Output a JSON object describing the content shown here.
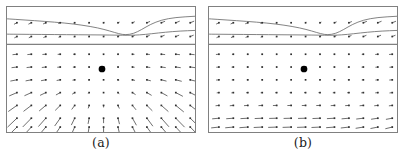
{
  "figure": {
    "background": "#ffffff",
    "border_color": "#808080",
    "arrow_color": "#3a3a3a",
    "node_color": "#2b2b2b",
    "curve_color": "#6b6b6b",
    "center_marker_color": "#000000",
    "panel_width": 190,
    "panel_height": 127
  },
  "panels": [
    {
      "id": "a",
      "caption": "(a)",
      "field_type": "divergent-fan",
      "grid": {
        "cols": 13,
        "rows": 7,
        "band_rows": 2
      },
      "divider_y": 38,
      "center_marker": {
        "x": 96,
        "y": 63,
        "r": 3.4
      },
      "chart_data_ref": 0
    },
    {
      "id": "b",
      "caption": "(b)",
      "field_type": "uniform-leftward",
      "grid": {
        "cols": 13,
        "rows": 7,
        "band_rows": 2
      },
      "divider_y": 38,
      "center_marker": {
        "x": 96,
        "y": 63,
        "r": 3.4
      },
      "chart_data_ref": 1
    }
  ],
  "chart_data": [
    {
      "type": "quiver",
      "title": "(a)",
      "xlabel": "",
      "ylabel": "",
      "xlim": [
        0,
        190
      ],
      "ylim": [
        0,
        127
      ],
      "grid": false,
      "legend": "none",
      "description": "Vector field with divergent fan pattern below a two-row upper band; arrows splay outward and downward, lengthening toward the bottom.",
      "band": {
        "rows_y": [
          16,
          30
        ],
        "x_start": 10,
        "x_step": 14.6,
        "cols": 13,
        "u": [
          -2.6,
          -2.6,
          -2.4,
          -1.6,
          -0.8,
          -0.3,
          0.4,
          1.2,
          2.0,
          2.8,
          3.4,
          3.6,
          3.6
        ],
        "v": [
          1.4,
          1.3,
          1.1,
          0.7,
          0.3,
          0.1,
          -0.2,
          -0.5,
          -0.9,
          -1.2,
          -1.4,
          -1.5,
          -1.5
        ]
      },
      "curves": [
        {
          "name": "upper-contour",
          "points": [
            [
              0,
              12
            ],
            [
              18,
              13.2
            ],
            [
              38,
              14.6
            ],
            [
              58,
              16.2
            ],
            [
              76,
              18.4
            ],
            [
              92,
              21.2
            ],
            [
              104,
              24.4
            ],
            [
              113,
              27.2
            ],
            [
              120,
              28.4
            ],
            [
              128,
              27.0
            ],
            [
              136,
              23.0
            ],
            [
              145,
              17.6
            ],
            [
              156,
              13.2
            ],
            [
              170,
              10.6
            ],
            [
              190,
              9.4
            ]
          ]
        },
        {
          "name": "lower-contour",
          "points": [
            [
              0,
              27.6
            ],
            [
              22,
              27.8
            ],
            [
              48,
              28.0
            ],
            [
              72,
              28.2
            ],
            [
              96,
              28.4
            ],
            [
              112,
              28.6
            ],
            [
              122,
              28.8
            ],
            [
              134,
              28.4
            ],
            [
              146,
              27.2
            ],
            [
              160,
              25.6
            ],
            [
              175,
              24.4
            ],
            [
              190,
              23.8
            ]
          ]
        }
      ],
      "field": {
        "x_start": 10,
        "x_step": 14.6,
        "y_start": 48,
        "y_step": 13.4,
        "cols": 13,
        "rows": 7,
        "rows_data": [
          {
            "y": 48,
            "u": [
              -4.0,
              -3.6,
              -3.0,
              -2.2,
              -1.2,
              -0.3,
              0.0,
              0.6,
              1.6,
              2.6,
              3.4,
              3.8,
              4.0
            ],
            "v": [
              0.4,
              0.3,
              0.2,
              0.1,
              0.0,
              0.0,
              0.0,
              0.0,
              0.1,
              0.2,
              0.3,
              0.4,
              0.4
            ]
          },
          {
            "y": 61,
            "u": [
              -5.0,
              -4.4,
              -3.6,
              -2.6,
              -1.4,
              -0.4,
              0.0,
              0.6,
              1.8,
              3.0,
              4.0,
              4.6,
              5.0
            ],
            "v": [
              0.6,
              0.5,
              0.4,
              0.2,
              0.1,
              0.0,
              0.0,
              0.1,
              0.2,
              0.4,
              0.5,
              0.6,
              0.6
            ]
          },
          {
            "y": 74,
            "u": [
              -6.2,
              -5.4,
              -4.4,
              -3.2,
              -1.8,
              -0.5,
              0.0,
              0.8,
              2.2,
              3.6,
              4.8,
              5.6,
              6.2
            ],
            "v": [
              1.2,
              1.0,
              0.8,
              0.6,
              0.3,
              0.1,
              0.0,
              0.2,
              0.5,
              0.9,
              1.2,
              1.4,
              1.5
            ]
          },
          {
            "y": 87,
            "u": [
              -7.4,
              -6.6,
              -5.4,
              -4.0,
              -2.2,
              -0.6,
              0.0,
              1.0,
              2.8,
              4.4,
              5.8,
              6.8,
              7.4
            ],
            "v": [
              3.2,
              3.0,
              2.6,
              2.2,
              1.4,
              0.6,
              0.2,
              0.8,
              1.8,
              2.6,
              3.2,
              3.6,
              3.8
            ]
          },
          {
            "y": 100,
            "u": [
              -8.4,
              -7.6,
              -6.4,
              -4.8,
              -2.8,
              -0.8,
              0.0,
              1.2,
              3.4,
              5.2,
              6.8,
              7.8,
              8.4
            ],
            "v": [
              6.0,
              5.8,
              5.4,
              4.8,
              3.8,
              2.6,
              1.6,
              2.8,
              4.2,
              5.2,
              6.0,
              6.4,
              6.6
            ]
          },
          {
            "y": 113,
            "u": [
              -9.2,
              -8.4,
              -7.2,
              -5.4,
              -3.2,
              -1.0,
              0.0,
              1.4,
              3.8,
              5.8,
              7.4,
              8.6,
              9.2
            ],
            "v": [
              8.8,
              8.6,
              8.2,
              7.6,
              6.6,
              5.4,
              4.6,
              5.6,
              6.8,
              7.8,
              8.4,
              8.8,
              9.0
            ]
          },
          {
            "y": 122,
            "u": [
              -9.6,
              -8.8,
              -7.6,
              -5.8,
              -3.4,
              -1.1,
              0.0,
              1.5,
              4.0,
              6.2,
              7.8,
              9.0,
              9.6
            ],
            "v": [
              9.6,
              9.4,
              9.0,
              8.4,
              7.6,
              6.6,
              5.8,
              6.6,
              7.8,
              8.6,
              9.2,
              9.6,
              9.8
            ]
          }
        ]
      }
    },
    {
      "type": "quiver",
      "title": "(b)",
      "xlabel": "",
      "ylabel": "",
      "xlim": [
        0,
        190
      ],
      "ylim": [
        0,
        127
      ],
      "grid": false,
      "legend": "none",
      "description": "Vector field with nearly uniform leftward horizontal flow in the lower rows and near-zero magnitude through the middle, below the same two-row upper band.",
      "band": {
        "rows_y": [
          16,
          30
        ],
        "x_start": 10,
        "x_step": 14.6,
        "cols": 13,
        "u": [
          -2.4,
          -2.4,
          -2.2,
          -1.4,
          -0.6,
          -0.2,
          0.3,
          1.0,
          1.8,
          2.6,
          3.2,
          3.4,
          3.4
        ],
        "v": [
          1.2,
          1.1,
          0.9,
          0.6,
          0.2,
          0.0,
          -0.2,
          -0.5,
          -0.8,
          -1.1,
          -1.3,
          -1.4,
          -1.4
        ]
      },
      "curves": [
        {
          "name": "upper-contour",
          "points": [
            [
              0,
              12
            ],
            [
              18,
              13.2
            ],
            [
              38,
              14.6
            ],
            [
              58,
              16.2
            ],
            [
              76,
              18.4
            ],
            [
              92,
              21.2
            ],
            [
              104,
              24.4
            ],
            [
              113,
              27.2
            ],
            [
              120,
              28.4
            ],
            [
              128,
              27.0
            ],
            [
              136,
              23.0
            ],
            [
              145,
              17.6
            ],
            [
              156,
              13.2
            ],
            [
              170,
              10.6
            ],
            [
              190,
              9.4
            ]
          ]
        },
        {
          "name": "lower-contour",
          "points": [
            [
              0,
              27.6
            ],
            [
              22,
              27.8
            ],
            [
              48,
              28.0
            ],
            [
              72,
              28.2
            ],
            [
              96,
              28.4
            ],
            [
              112,
              28.6
            ],
            [
              122,
              28.8
            ],
            [
              134,
              28.4
            ],
            [
              146,
              27.2
            ],
            [
              160,
              25.6
            ],
            [
              175,
              24.4
            ],
            [
              190,
              23.8
            ]
          ]
        }
      ],
      "field": {
        "x_start": 10,
        "x_step": 14.6,
        "y_start": 48,
        "y_step": 13.4,
        "cols": 13,
        "rows": 7,
        "rows_data": [
          {
            "y": 48,
            "u": [
              -2.6,
              -1.0,
              -0.6,
              -0.4,
              -0.3,
              -0.2,
              -0.2,
              -0.3,
              -0.4,
              -0.6,
              -1.2,
              -2.2,
              -2.8
            ],
            "v": [
              0.2,
              0.1,
              0.0,
              0.0,
              0.0,
              0.0,
              0.0,
              0.0,
              0.0,
              0.0,
              0.1,
              0.2,
              0.2
            ]
          },
          {
            "y": 61,
            "u": [
              -2.2,
              -1.4,
              -0.8,
              -0.5,
              -0.3,
              -0.2,
              -0.2,
              -0.3,
              -0.5,
              -0.8,
              -1.4,
              -2.0,
              -2.4
            ],
            "v": [
              0.2,
              0.1,
              0.0,
              0.0,
              0.0,
              0.0,
              0.0,
              0.0,
              0.0,
              0.1,
              0.1,
              0.2,
              0.2
            ]
          },
          {
            "y": 74,
            "u": [
              -2.4,
              -1.2,
              -0.7,
              -0.4,
              -0.3,
              -0.2,
              -0.2,
              -0.3,
              -0.4,
              -0.7,
              -1.2,
              -2.0,
              -2.6
            ],
            "v": [
              0.2,
              0.1,
              0.0,
              0.0,
              0.0,
              0.0,
              0.0,
              0.0,
              0.0,
              0.0,
              0.1,
              0.2,
              0.2
            ]
          },
          {
            "y": 87,
            "u": [
              -1.8,
              -1.6,
              -1.4,
              -1.2,
              -1.2,
              -1.1,
              -1.1,
              -1.2,
              -1.3,
              -1.5,
              -1.8,
              -2.2,
              -2.4
            ],
            "v": [
              0.2,
              0.2,
              0.1,
              0.1,
              0.1,
              0.0,
              0.0,
              0.0,
              0.1,
              0.1,
              0.2,
              0.2,
              0.3
            ]
          },
          {
            "y": 100,
            "u": [
              -3.0,
              -3.2,
              -3.4,
              -3.4,
              -3.4,
              -3.4,
              -3.4,
              -3.4,
              -3.4,
              -3.4,
              -3.4,
              -3.2,
              -3.0
            ],
            "v": [
              0.3,
              0.3,
              0.2,
              0.2,
              0.1,
              0.1,
              0.1,
              0.1,
              0.2,
              0.2,
              0.3,
              0.3,
              0.4
            ]
          },
          {
            "y": 113,
            "u": [
              -6.4,
              -6.8,
              -7.0,
              -7.2,
              -7.2,
              -7.2,
              -7.2,
              -7.2,
              -7.2,
              -7.0,
              -6.8,
              -6.4,
              -6.0
            ],
            "v": [
              0.6,
              0.5,
              0.4,
              0.3,
              0.2,
              0.2,
              0.2,
              0.3,
              0.4,
              0.6,
              0.8,
              1.0,
              1.1
            ]
          },
          {
            "y": 122,
            "u": [
              -7.4,
              -7.8,
              -8.0,
              -8.2,
              -8.2,
              -8.2,
              -8.2,
              -8.2,
              -8.0,
              -7.8,
              -7.4,
              -7.0,
              -6.6
            ],
            "v": [
              0.8,
              0.7,
              0.6,
              0.4,
              0.3,
              0.3,
              0.3,
              0.4,
              0.6,
              0.9,
              1.2,
              1.4,
              1.6
            ]
          }
        ]
      }
    }
  ]
}
